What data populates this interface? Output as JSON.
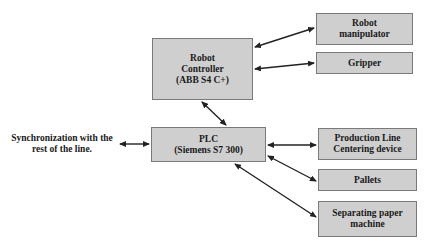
{
  "diagram": {
    "nodes": {
      "robot_controller": {
        "label": "Robot\nController\n(ABB S4 C+)"
      },
      "plc": {
        "label": "PLC\n(Siemens S7 300)"
      },
      "robot_manipulator": {
        "label": "Robot\nmanipulator"
      },
      "gripper": {
        "label": "Gripper"
      },
      "production_line": {
        "label": "Production Line\nCentering device"
      },
      "pallets": {
        "label": "Pallets"
      },
      "separating_paper": {
        "label": "Separating paper\nmachine"
      }
    },
    "external_label": "Synchronization with the\nrest of the line.",
    "edges": [
      {
        "from": "robot_controller",
        "to": "robot_manipulator",
        "direction": "bidirectional"
      },
      {
        "from": "robot_controller",
        "to": "gripper",
        "direction": "bidirectional"
      },
      {
        "from": "robot_controller",
        "to": "plc",
        "direction": "bidirectional"
      },
      {
        "from": "external",
        "to": "plc",
        "direction": "bidirectional"
      },
      {
        "from": "plc",
        "to": "production_line",
        "direction": "bidirectional"
      },
      {
        "from": "plc",
        "to": "pallets",
        "direction": "bidirectional"
      },
      {
        "from": "plc",
        "to": "separating_paper",
        "direction": "bidirectional"
      }
    ],
    "colors": {
      "box_fill": "#cfcfcf",
      "box_border": "#7a7a7a",
      "arrow": "#222222"
    }
  }
}
